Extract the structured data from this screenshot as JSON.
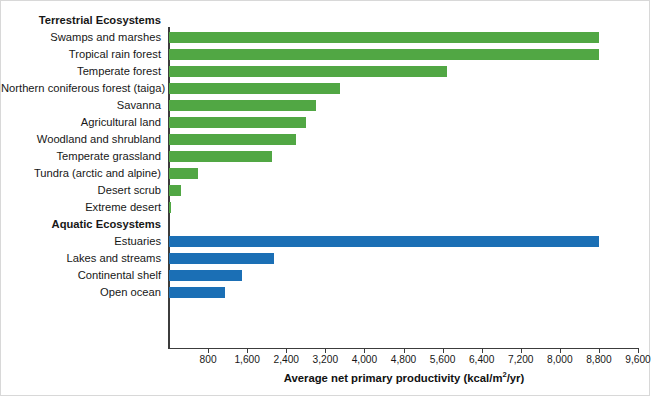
{
  "chart_data": {
    "type": "bar",
    "orientation": "horizontal",
    "title": "",
    "xlabel": "Average net primary productivity (kcal/m2/yr)",
    "xlabel_parts": {
      "before": "Average net primary productivity (kcal/m",
      "sup": "2",
      "after": "/yr)"
    },
    "ylabel": "",
    "xlim": [
      0,
      9600
    ],
    "xticks": [
      800,
      1600,
      2400,
      3200,
      4000,
      4800,
      5600,
      6400,
      7200,
      8000,
      8800,
      9600
    ],
    "xtick_labels": [
      "800",
      "1,600",
      "2,400",
      "3,200",
      "4,000",
      "4,800",
      "5,600",
      "6,400",
      "7,200",
      "8,000",
      "8,800",
      "9,600"
    ],
    "grid": false,
    "legend": null,
    "groups": [
      {
        "name": "Terrestrial Ecosystems",
        "color": "#51a744",
        "categories": [
          "Swamps and marshes",
          "Tropical rain forest",
          "Temperate forest",
          "Northern coniferous forest (taiga)",
          "Savanna",
          "Agricultural land",
          "Woodland and shrubland",
          "Temperate grassland",
          "Tundra (arctic and alpine)",
          "Desert scrub",
          "Extreme desert"
        ],
        "values": [
          8800,
          8800,
          5700,
          3500,
          3000,
          2800,
          2600,
          2100,
          600,
          250,
          40
        ]
      },
      {
        "name": "Aquatic Ecosystems",
        "color": "#1b6fb5",
        "categories": [
          "Estuaries",
          "Lakes and streams",
          "Continental shelf",
          "Open ocean"
        ],
        "values": [
          8800,
          2150,
          1500,
          1150
        ]
      }
    ]
  },
  "colors": {
    "terrestrial": "#51a744",
    "aquatic": "#1b6fb5",
    "axis": "#3c3c3c",
    "text": "#171717",
    "background": "#ffffff"
  }
}
